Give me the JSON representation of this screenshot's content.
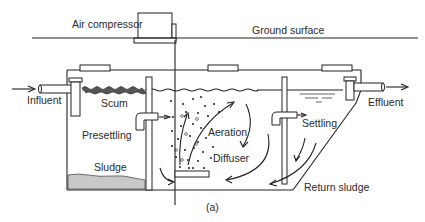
{
  "diagram": {
    "caption": "(a)",
    "labels": {
      "air_compressor": "Air compressor",
      "ground_surface": "Ground surface",
      "influent": "Influent",
      "effluent": "Effluent",
      "scum": "Scum",
      "presettling": "Presettling",
      "sludge": "Sludge",
      "aeration": "Aeration",
      "diffuser": "Diffuser",
      "settling": "Settling",
      "return_sludge": "Return sludge"
    },
    "colors": {
      "line": "#222222",
      "sludge_fill": "#c8c8c8",
      "background": "#ffffff"
    }
  }
}
